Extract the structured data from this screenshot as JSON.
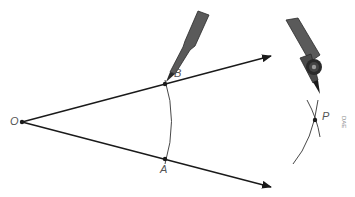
{
  "diagram": {
    "points": {
      "O": {
        "label": "O",
        "x": 22,
        "y": 122
      },
      "B": {
        "label": "B",
        "x": 165,
        "y": 84
      },
      "A": {
        "label": "A",
        "x": 165,
        "y": 159
      },
      "P": {
        "label": "P",
        "x": 315,
        "y": 120
      }
    },
    "rays": [
      {
        "from": "O",
        "through": "B",
        "end_x": 271,
        "end_y": 56
      },
      {
        "from": "O",
        "through": "A",
        "end_x": 271,
        "end_y": 187
      }
    ],
    "figure_code": "DAE",
    "colors": {
      "line": "#1a1a1a",
      "compass_body": "#5a5a5a",
      "label": "#555555"
    }
  }
}
